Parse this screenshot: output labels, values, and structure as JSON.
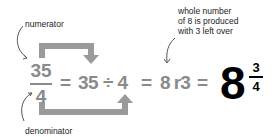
{
  "annotations": {
    "numerator": "numerator",
    "denominator": "denominator",
    "remainder_note_line1": "whole number",
    "remainder_note_line2": "of 8 is produced",
    "remainder_note_line3": "with 3 left over"
  },
  "equation": {
    "fraction_numerator": "35",
    "fraction_denominator": "4",
    "equals_1": "=",
    "division_expression": "35 ÷ 4",
    "equals_2": "=",
    "quotient_with_remainder": "8 r3",
    "equals_3": "=",
    "mixed_whole": "8",
    "mixed_numerator": "3",
    "mixed_denominator": "4"
  },
  "colors": {
    "grey_text": "#8a8a8a",
    "arrow_grey": "#9a9a9a",
    "black_result": "#000000",
    "label_text": "#222222"
  }
}
